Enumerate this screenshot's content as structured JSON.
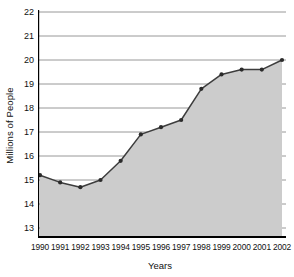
{
  "chart_data": {
    "type": "area",
    "title": "",
    "xlabel": "Years",
    "ylabel": "Millions of People",
    "categories": [
      "1990",
      "1991",
      "1992",
      "1993",
      "1994",
      "1995",
      "1996",
      "1997",
      "1998",
      "1999",
      "2000",
      "2001",
      "2002"
    ],
    "values": [
      15.2,
      14.9,
      14.7,
      15.0,
      15.8,
      16.9,
      17.2,
      17.5,
      18.8,
      19.4,
      19.6,
      19.6,
      20.0
    ],
    "series": [
      {
        "name": "Millions of People",
        "values": [
          15.2,
          14.9,
          14.7,
          15.0,
          15.8,
          16.9,
          17.2,
          17.5,
          18.8,
          19.4,
          19.6,
          19.6,
          20.0
        ]
      }
    ],
    "ylim": [
      13,
      22
    ],
    "yticks": [
      13,
      14,
      15,
      16,
      17,
      18,
      19,
      20,
      21,
      22
    ],
    "ytick_labels": [
      "13",
      "14",
      "15",
      "16",
      "17",
      "18",
      "19",
      "20",
      "21",
      "22"
    ],
    "xtick_labels": [
      "1990",
      "1991",
      "1992",
      "1993",
      "1994",
      "1995",
      "1996",
      "1997",
      "1998",
      "1999",
      "2000",
      "2001",
      "2002"
    ],
    "grid": "horizontal",
    "legend": "none",
    "colors": {
      "area_fill": "#cccccc",
      "line": "#3d3d3d",
      "marker": "#2b2b2b",
      "gridline": "#8c8c8c",
      "axis": "#000000",
      "background": "#ffffff",
      "text": "#111111"
    }
  },
  "axes": {
    "y_title": "Millions of People",
    "x_title": "Years"
  }
}
